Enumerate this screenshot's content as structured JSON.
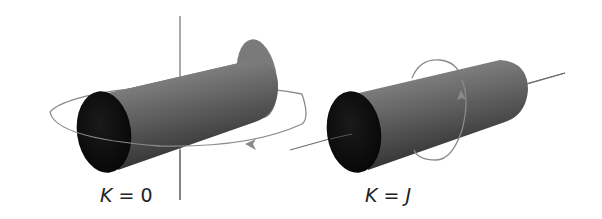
{
  "figures": [
    {
      "id": "left",
      "label_var": "K",
      "label_eq": " = ",
      "label_val": "0",
      "rotation_axis": "perpendicular",
      "description": "Cylinder rotating about an axis perpendicular to its length"
    },
    {
      "id": "right",
      "label_var": "K",
      "label_eq": " = ",
      "label_val": "J",
      "rotation_axis": "longitudinal",
      "description": "Cylinder rotating about its own long axis"
    }
  ],
  "colors": {
    "background": "#ffffff",
    "axis": "#6e6e6e",
    "orbit": "#8a8a8a",
    "cylinder_body_light": "#8c8c8c",
    "cylinder_body_dark": "#3a3a3a",
    "cylinder_face": "#111111",
    "label": "#222222"
  }
}
